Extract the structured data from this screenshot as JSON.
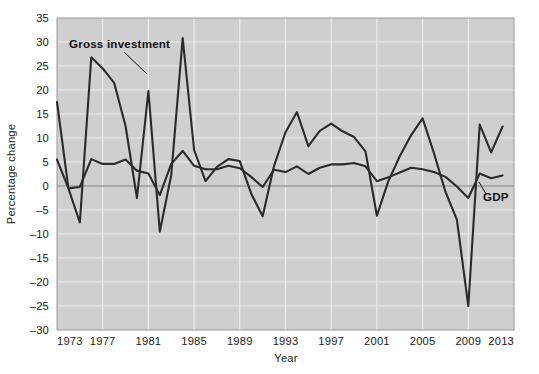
{
  "chart_data": {
    "type": "line",
    "title": "",
    "xlabel": "Year",
    "ylabel": "Percentage change",
    "xlim": [
      1973,
      2013
    ],
    "ylim": [
      -30,
      35
    ],
    "grid": true,
    "legend_position": "inline-annotation",
    "x_ticks": [
      "1973",
      "1977",
      "1981",
      "1985",
      "1989",
      "1993",
      "1997",
      "2001",
      "2005",
      "2009",
      "2013"
    ],
    "x_tick_values": [
      1973,
      1977,
      1981,
      1985,
      1989,
      1993,
      1997,
      2001,
      2005,
      2009,
      2013
    ],
    "y_ticks": [
      "35",
      "30",
      "25",
      "20",
      "15",
      "10",
      "5",
      "0",
      "-5",
      "-10",
      "-15",
      "-20",
      "-25",
      "-30"
    ],
    "y_tick_values": [
      35,
      30,
      25,
      20,
      15,
      10,
      5,
      0,
      -5,
      -10,
      -15,
      -20,
      -25,
      -30
    ],
    "x": [
      1973,
      1974,
      1975,
      1976,
      1977,
      1978,
      1979,
      1980,
      1981,
      1982,
      1983,
      1984,
      1985,
      1986,
      1987,
      1988,
      1989,
      1990,
      1991,
      1992,
      1993,
      1994,
      1995,
      1996,
      1997,
      1998,
      1999,
      2000,
      2001,
      2002,
      2003,
      2004,
      2005,
      2006,
      2007,
      2008,
      2009,
      2010,
      2011,
      2012
    ],
    "series": [
      {
        "name": "Gross investment",
        "color": "#2b2b2b",
        "values": [
          17.5,
          -0.5,
          -7.6,
          26.8,
          24.5,
          21.5,
          12.5,
          -2.5,
          19.8,
          -9.5,
          2.3,
          30.8,
          7.5,
          1.0,
          4.0,
          5.6,
          5.2,
          -1.6,
          -6.3,
          4.2,
          11.2,
          15.4,
          8.3,
          11.5,
          13.0,
          11.4,
          10.2,
          7.2,
          -6.2,
          1.0,
          6.2,
          10.6,
          14.1,
          6.8,
          -1.2,
          -7.0,
          -25.0,
          12.8,
          7.0,
          12.4
        ]
      },
      {
        "name": "GDP",
        "color": "#2b2b2b",
        "values": [
          5.5,
          -0.5,
          -0.2,
          5.6,
          4.6,
          4.6,
          5.5,
          3.2,
          2.6,
          -1.9,
          4.6,
          7.3,
          4.2,
          3.5,
          3.5,
          4.2,
          3.7,
          1.9,
          -0.2,
          3.4,
          2.9,
          4.1,
          2.5,
          3.8,
          4.5,
          4.5,
          4.8,
          4.1,
          1.0,
          1.8,
          2.8,
          3.8,
          3.5,
          2.9,
          1.9,
          -0.1,
          -2.5,
          2.6,
          1.6,
          2.2
        ]
      }
    ],
    "annotations": [
      {
        "text": "Gross investment",
        "series": "Gross investment",
        "x": 1975.2,
        "y": 32.5
      },
      {
        "text": "GDP",
        "series": "GDP",
        "x": 2010.2,
        "y": -1.2
      }
    ]
  }
}
